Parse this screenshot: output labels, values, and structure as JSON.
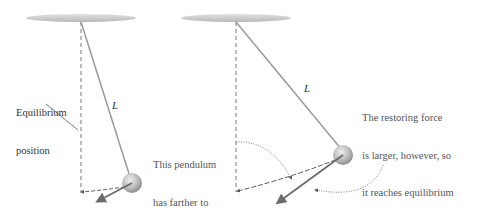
{
  "diagram": {
    "left_pendulum": {
      "length_label": "L",
      "equilibrium_label_line1": "Equilibrium",
      "equilibrium_label_line2": "position",
      "note_line1": "This pendulum",
      "note_line2": "has farther to",
      "note_line3": "go to reach",
      "note_line4": "equilibrium."
    },
    "right_pendulum": {
      "length_label": "L",
      "note_line1": "The restoring force",
      "note_line2": "is larger, however, so",
      "note_line3": "it reaches equilibrium",
      "note_line4": "in the same time.",
      "note_line5": "Pendulums of equal",
      "note_line6": "length have equal",
      "note_line7": "periods."
    },
    "colors": {
      "ceiling": "#c8c8c8",
      "string": "#9a9a9a",
      "bob": "#b5b5b5",
      "force_arrow": "#6b6b6b",
      "dashed": "#555555"
    }
  }
}
